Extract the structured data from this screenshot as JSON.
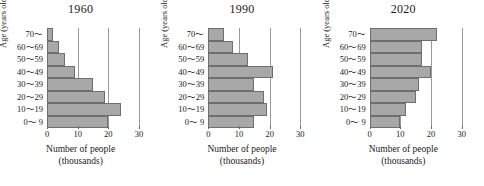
{
  "chart_data": [
    {
      "type": "bar",
      "orientation": "horizontal",
      "title": "1960",
      "xlabel": "Number of people",
      "xlabel_sub": "(thousands)",
      "ylabel": "Age (years old)",
      "categories": [
        "0〜 9",
        "10〜19",
        "20〜29",
        "30〜39",
        "40〜49",
        "50〜59",
        "60〜69",
        "70〜"
      ],
      "values": [
        20,
        24,
        19,
        15,
        9,
        6,
        4,
        2
      ],
      "xlim": [
        0,
        30
      ],
      "xticks": [
        0,
        10,
        20,
        30
      ],
      "grid": true,
      "legend": "none"
    },
    {
      "type": "bar",
      "orientation": "horizontal",
      "title": "1990",
      "xlabel": "Number of people",
      "xlabel_sub": "(thousands)",
      "ylabel": "Age (years old)",
      "categories": [
        "0〜 9",
        "10〜19",
        "20〜29",
        "30〜39",
        "40〜49",
        "50〜59",
        "60〜69",
        "70〜"
      ],
      "values": [
        15,
        19,
        18,
        15,
        21,
        13,
        8,
        5
      ],
      "xlim": [
        0,
        30
      ],
      "xticks": [
        0,
        10,
        20,
        30
      ],
      "grid": true,
      "legend": "none"
    },
    {
      "type": "bar",
      "orientation": "horizontal",
      "title": "2020",
      "xlabel": "Number of people",
      "xlabel_sub": "(thousands)",
      "ylabel": "Age (years old)",
      "categories": [
        "0〜 9",
        "10〜19",
        "20〜29",
        "30〜39",
        "40〜49",
        "50〜59",
        "60〜69",
        "70〜"
      ],
      "values": [
        10,
        12,
        15,
        16,
        20,
        17,
        17,
        22
      ],
      "xlim": [
        0,
        30
      ],
      "xticks": [
        0,
        10,
        20,
        30
      ],
      "grid": true,
      "legend": "none"
    }
  ],
  "style": {
    "bar_fill": "#a8a8a8",
    "bar_stroke": "#6e6e6e",
    "gridline_color": "#9a9a9a",
    "axis_color": "#6b6b6b",
    "background": "#ffffff"
  }
}
